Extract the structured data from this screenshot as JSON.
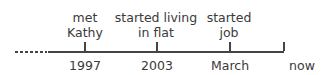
{
  "events": [
    {
      "line1": "met",
      "line2": "Kathy",
      "axis": "1997"
    },
    {
      "line1": "started living",
      "line2": "in flat",
      "axis": "2003"
    },
    {
      "line1": "started",
      "line2": "job",
      "axis": "March"
    },
    {
      "line1": "",
      "line2": "",
      "axis": "now"
    }
  ]
}
